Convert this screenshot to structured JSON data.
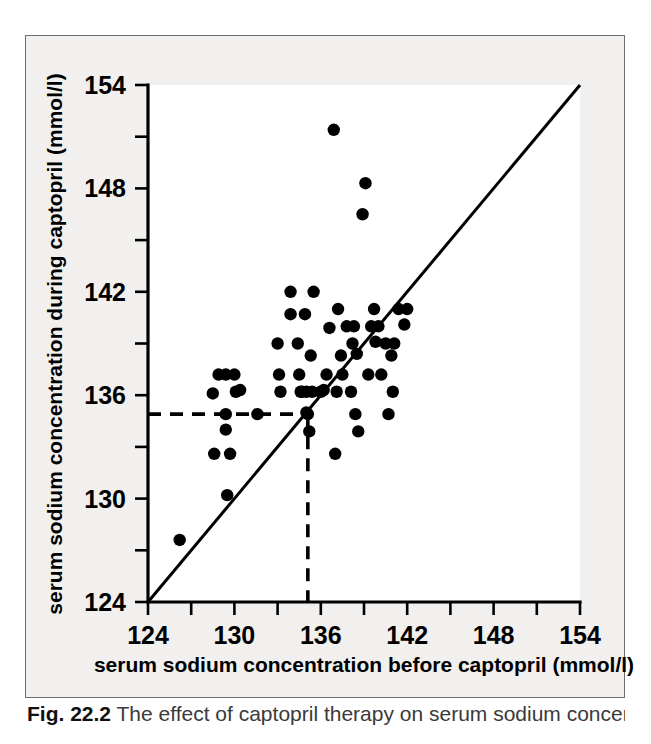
{
  "figure": {
    "caption_label": "Fig. 22.2",
    "caption_text": "The effect of captopril therapy on serum sodium concentration"
  },
  "chart_data": {
    "type": "scatter",
    "title": "",
    "xlabel": "serum sodium concentration before captopril (mmol/l)",
    "ylabel": "serum sodium concentration during captopril (mmol/l)",
    "xlim": [
      124,
      154
    ],
    "ylim": [
      124,
      154
    ],
    "x_ticks": [
      124,
      130,
      136,
      142,
      148,
      154
    ],
    "x_tick_labels": [
      "124",
      "130",
      "136",
      "142",
      "148",
      "154"
    ],
    "x_minor_ticks": [
      127,
      133,
      139,
      145,
      151
    ],
    "y_ticks": [
      124,
      130,
      136,
      142,
      148,
      154
    ],
    "y_tick_labels": [
      "124",
      "130",
      "136",
      "142",
      "148",
      "154"
    ],
    "y_minor_ticks": [
      127,
      133,
      139,
      145,
      151
    ],
    "grid": false,
    "legend": false,
    "marker": "filled-circle",
    "marker_color": "#000000",
    "identity_line": {
      "label": "line of equality",
      "from": [
        124,
        124
      ],
      "to": [
        154,
        154
      ]
    },
    "reference_lines": [
      {
        "name": "median-horizontal",
        "orientation": "horizontal",
        "value": 134.9,
        "style": "dashed",
        "from_x": 124,
        "to_x": 135.1
      },
      {
        "name": "median-vertical",
        "orientation": "vertical",
        "value": 135.1,
        "style": "dashed",
        "from_y": 124,
        "to_y": 134.9
      }
    ],
    "points": [
      [
        126.2,
        127.6
      ],
      [
        128.5,
        136.1
      ],
      [
        128.6,
        132.6
      ],
      [
        128.9,
        137.2
      ],
      [
        129.4,
        137.2
      ],
      [
        129.4,
        134.9
      ],
      [
        129.4,
        134.0
      ],
      [
        129.5,
        130.2
      ],
      [
        129.7,
        132.6
      ],
      [
        130.0,
        137.2
      ],
      [
        130.1,
        136.2
      ],
      [
        130.4,
        136.3
      ],
      [
        131.6,
        134.9
      ],
      [
        133.0,
        139.0
      ],
      [
        133.1,
        137.2
      ],
      [
        133.2,
        136.2
      ],
      [
        133.9,
        142.0
      ],
      [
        133.9,
        140.7
      ],
      [
        134.4,
        139.0
      ],
      [
        134.5,
        137.2
      ],
      [
        134.6,
        136.2
      ],
      [
        134.7,
        136.2
      ],
      [
        134.9,
        140.7
      ],
      [
        135.0,
        136.2
      ],
      [
        135.0,
        135.0
      ],
      [
        135.1,
        134.9
      ],
      [
        135.2,
        133.9
      ],
      [
        135.3,
        138.3
      ],
      [
        135.4,
        136.2
      ],
      [
        135.5,
        142.0
      ],
      [
        136.0,
        136.2
      ],
      [
        136.2,
        136.3
      ],
      [
        136.4,
        137.2
      ],
      [
        136.6,
        139.9
      ],
      [
        136.9,
        151.4
      ],
      [
        137.0,
        132.6
      ],
      [
        137.1,
        136.2
      ],
      [
        137.2,
        141.0
      ],
      [
        137.4,
        138.3
      ],
      [
        137.5,
        137.2
      ],
      [
        137.8,
        140.0
      ],
      [
        138.1,
        136.2
      ],
      [
        138.2,
        139.0
      ],
      [
        138.3,
        140.0
      ],
      [
        138.4,
        134.9
      ],
      [
        138.5,
        138.4
      ],
      [
        138.6,
        133.9
      ],
      [
        138.9,
        146.5
      ],
      [
        139.1,
        148.3
      ],
      [
        139.3,
        137.2
      ],
      [
        139.5,
        140.0
      ],
      [
        139.7,
        141.0
      ],
      [
        139.8,
        139.1
      ],
      [
        140.0,
        140.0
      ],
      [
        140.2,
        137.2
      ],
      [
        140.5,
        139.0
      ],
      [
        140.7,
        134.9
      ],
      [
        140.9,
        138.3
      ],
      [
        141.0,
        136.2
      ],
      [
        141.1,
        139.0
      ],
      [
        141.4,
        141.0
      ],
      [
        141.8,
        140.1
      ],
      [
        142.0,
        141.0
      ]
    ]
  }
}
